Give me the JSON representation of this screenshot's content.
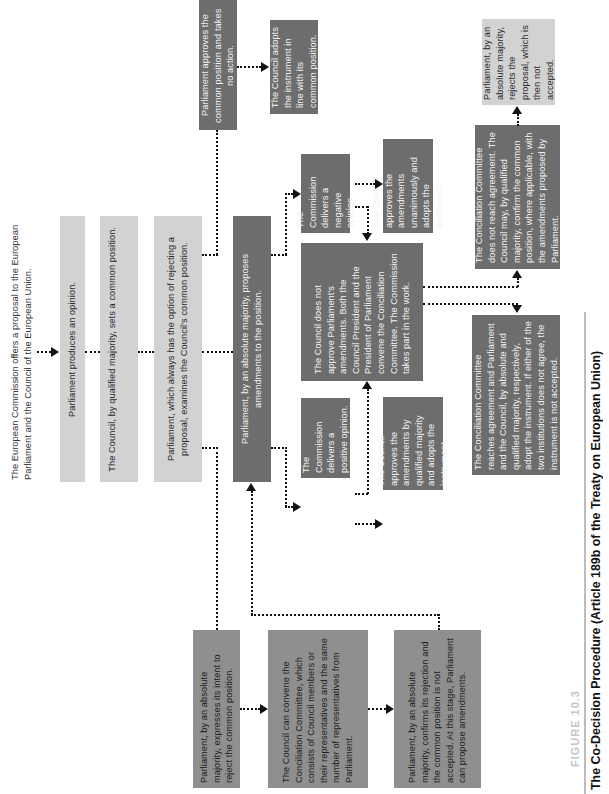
{
  "figure": {
    "label": "FIGURE 10.3",
    "title": "The Co-Decision Procedure (Article 189b of the Treaty on European Union)"
  },
  "intro": "The European Commission offers a proposal to the European Parliament and the Council of the European Union.",
  "boxes": {
    "parliament_opinion": "Parliament produces an opinion.",
    "council_common_position": "The Council, by qualified majority, sets a common position.",
    "parliament_examines": "Parliament, which always has the option of rejecting a proposal, examines the Council's common position.",
    "parliament_proposes_amendments": "Parliament, by an absolute majority, proposes amendments to the position.",
    "parliament_approves": "Parliament approves the common position and takes no action.",
    "council_adopts_common": "The Council adopts the instrument in line with its common position.",
    "commission_negative": "The Commission delivers a negative opinion.",
    "council_unanimous": "The Council approves the amendments unanimously and adopts the instrument.",
    "council_not_approve": "The Council does not approve Parliament's amendments. Both the Council President and the President of Parliament convene the Conciliation Committee. The Commission takes part in the work.",
    "commission_positive": "The Commission delivers a positive opinion.",
    "council_qualified": "The Council approves the amendments by qualified majority and adopts the instrument.",
    "conciliation_no_agreement": "The Conciliation Committee does not reach agreement. The Council may, by qualified majority, confirm the common position, where applicable, with the amendments proposed by Parliament.",
    "parliament_rejects": "Parliament, by an absolute majority, rejects the proposal, which is then not accepted.",
    "conciliation_agreement": "The Conciliation Committee reaches agreement and Parliament and the Council, by absolute and qualified majority, respectively, adopt the instrument. If either of the two institutions does not agree, the instrument is not accepted.",
    "parliament_intent_reject": "Parliament, by an absolute majority, expresses its intent to reject the common position.",
    "council_convene": "The Council can convene the Conciliation Committee, which consists of Council members or their representatives and the same number of representatives from Parliament.",
    "parliament_confirms_rejection": "Parliament, by an absolute majority, confirms its rejection and the common position is not accepted. At this stage, Parliament can propose amendments."
  },
  "colors": {
    "light_box": "#d2d2d2",
    "dark_box": "#6d6d6d",
    "mid_box": "#8f8f8f",
    "connector": "#111111"
  }
}
